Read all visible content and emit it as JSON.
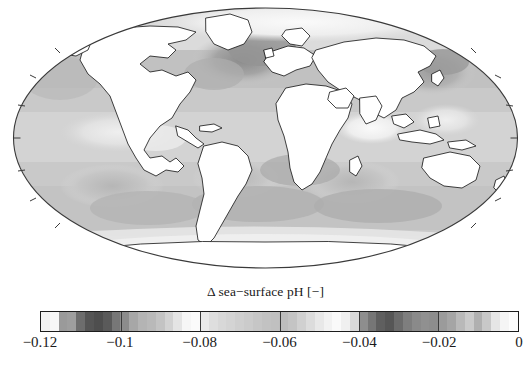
{
  "figure": {
    "kind": "global-map-with-colorbar",
    "background_color": "#ffffff",
    "foreground_color": "#1a1a1a"
  },
  "map": {
    "projection": "Mollweide",
    "land_fill": "#ffffff",
    "coastline_color": "#111111",
    "outline_color": "#3a3a3a",
    "graticule_visible": "false",
    "border_ticks": "true"
  },
  "colorbar": {
    "orientation": "horizontal",
    "title": "Δ sea−surface pH [−]",
    "border_color": "#1c1c1c",
    "tick_line_color": "#3b3b3b",
    "tick_labels": [
      "−0.12",
      "−0.1",
      "−0.08",
      "−0.06",
      "−0.04",
      "−0.02",
      "0"
    ],
    "tick_values": [
      -0.12,
      -0.1,
      -0.08,
      -0.06,
      -0.04,
      -0.02,
      0
    ],
    "tick_positions_pct": [
      0,
      16.667,
      33.333,
      50,
      66.667,
      83.333,
      100
    ],
    "segment_colors": [
      "#f2f2f2",
      "#f7f7f7",
      "#9a9a9a",
      "#9e9e9e",
      "#6d6d6d",
      "#555555",
      "#4e4e4e",
      "#5a5a5a",
      "#777777",
      "#8c8c8c",
      "#a7a7a7",
      "#b4b4b4",
      "#b9b9b9",
      "#c3c3c3",
      "#d2d2d2",
      "#e4e4e4",
      "#f6f6f6",
      "#fbfbfb",
      "#eaeaea",
      "#dedede",
      "#d8d8d8",
      "#d4d4d4",
      "#cfcfcf",
      "#cbcbcb",
      "#c6c6c6",
      "#c2c2c2",
      "#c0c0c0",
      "#bdbdbd",
      "#c4c4c4",
      "#d0d0d0",
      "#dcdcdc",
      "#e8e8e8",
      "#f2f2f2",
      "#fafafa",
      "#f0f0f0",
      "#d9d9d9",
      "#8e8e8e",
      "#767676",
      "#5f5f5f",
      "#565656",
      "#6b6b6b",
      "#7e7e7e",
      "#8a8a8a",
      "#909090",
      "#8d8d8d",
      "#9b9b9b",
      "#a5a5a5",
      "#b9b9b9",
      "#cacaca",
      "#b0b0b0",
      "#c8c8c8",
      "#e6e6e6",
      "#f5f5f5",
      "#fdfdfd"
    ]
  },
  "chart_data": {
    "type": "heatmap",
    "title": "Δ sea−surface pH [−]",
    "xlabel": "",
    "ylabel": "",
    "projection": "Mollweide",
    "colorbar_label": "Δ sea−surface pH [−]",
    "colormap": "grayscale",
    "colormap_direction": "dark = more negative",
    "zlim": [
      -0.12,
      0
    ],
    "ztick_labels": [
      "−0.12",
      "−0.1",
      "−0.08",
      "−0.06",
      "−0.04",
      "−0.02",
      "0"
    ],
    "ztick_values": [
      -0.12,
      -0.1,
      -0.08,
      -0.06,
      -0.04,
      -0.02,
      0
    ],
    "grid": "off",
    "legend_position": "below-axes",
    "units": "pH units (dimensionless)",
    "variable": "change in sea-surface pH",
    "regions": [
      {
        "name": "North Atlantic subpolar gyre",
        "lon": -30,
        "lat": 55,
        "value": -0.105
      },
      {
        "name": "Greenland / Labrador Sea",
        "lon": -45,
        "lat": 62,
        "value": -0.115
      },
      {
        "name": "Norwegian & Barents Sea",
        "lon": 10,
        "lat": 70,
        "value": -0.108
      },
      {
        "name": "North Pacific subpolar gyre",
        "lon": 170,
        "lat": 48,
        "value": -0.095
      },
      {
        "name": "Bering Sea / Sea of Okhotsk",
        "lon": 160,
        "lat": 58,
        "value": -0.1
      },
      {
        "name": "Equatorial Pacific upwelling",
        "lon": -120,
        "lat": 0,
        "value": -0.055
      },
      {
        "name": "Eastern tropical Pacific",
        "lon": -95,
        "lat": 5,
        "value": -0.048
      },
      {
        "name": "Tropical Atlantic",
        "lon": -25,
        "lat": 5,
        "value": -0.062
      },
      {
        "name": "Arabian Sea",
        "lon": 62,
        "lat": 15,
        "value": -0.06
      },
      {
        "name": "Bay of Bengal",
        "lon": 88,
        "lat": 14,
        "value": -0.045
      },
      {
        "name": "Indian Ocean subtropical gyre",
        "lon": 80,
        "lat": -25,
        "value": -0.07
      },
      {
        "name": "South Atlantic subtropical gyre",
        "lon": -20,
        "lat": -30,
        "value": -0.072
      },
      {
        "name": "South Pacific subtropical gyre",
        "lon": -130,
        "lat": -30,
        "value": -0.068
      },
      {
        "name": "Southern Ocean (Atlantic sector)",
        "lon": -10,
        "lat": -55,
        "value": -0.082
      },
      {
        "name": "Southern Ocean (Indian sector)",
        "lon": 90,
        "lat": -55,
        "value": -0.084
      },
      {
        "name": "Southern Ocean (Pacific sector)",
        "lon": -150,
        "lat": -55,
        "value": -0.08
      },
      {
        "name": "Antarctic coastal / Ross Sea",
        "lon": 180,
        "lat": -70,
        "value": -0.04
      },
      {
        "name": "Weddell Sea",
        "lon": -40,
        "lat": -70,
        "value": -0.045
      },
      {
        "name": "Arctic Ocean",
        "lon": 0,
        "lat": 85,
        "value": -0.03
      },
      {
        "name": "Mediterranean Sea",
        "lon": 18,
        "lat": 36,
        "value": -0.075
      }
    ]
  }
}
